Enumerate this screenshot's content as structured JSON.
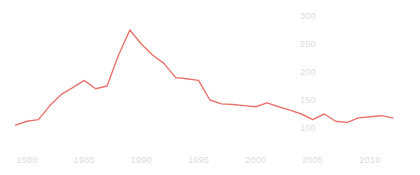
{
  "chart_data": {
    "type": "line",
    "title": "",
    "subtitle": "",
    "xlabel": "",
    "ylabel": "",
    "x": [
      1979,
      1980,
      1981,
      1982,
      1983,
      1984,
      1985,
      1986,
      1987,
      1988,
      1989,
      1990,
      1991,
      1992,
      1993,
      1994,
      1995,
      1996,
      1997,
      1998,
      1999,
      2000,
      2001,
      2002,
      2003,
      2004,
      2005,
      2006,
      2007,
      2008,
      2009,
      2010,
      2011,
      2012
    ],
    "values": [
      105,
      112,
      115,
      140,
      160,
      172,
      185,
      170,
      175,
      230,
      275,
      250,
      230,
      215,
      190,
      188,
      185,
      150,
      143,
      142,
      140,
      138,
      145,
      138,
      132,
      125,
      115,
      125,
      112,
      110,
      118,
      120,
      122,
      118
    ],
    "series": [
      {
        "name": "series-1",
        "color": "#e8736a",
        "values": [
          105,
          112,
          115,
          140,
          160,
          172,
          185,
          170,
          175,
          230,
          275,
          250,
          230,
          215,
          190,
          188,
          185,
          150,
          143,
          142,
          140,
          138,
          145,
          138,
          132,
          125,
          115,
          125,
          112,
          110,
          118,
          120,
          122,
          118
        ]
      }
    ],
    "xlim": [
      1978.5,
      2012.5
    ],
    "ylim": [
      95,
      305
    ],
    "x_ticks": [
      1980,
      1985,
      1990,
      1995,
      2000,
      2005,
      2010
    ],
    "x_tick_labels": [
      "1980",
      "1985",
      "1990",
      "1995",
      "2000",
      "2005",
      "2010"
    ],
    "y_ticks": [
      100,
      150,
      200,
      250,
      300
    ],
    "y_tick_labels": [
      "100",
      "150",
      "200",
      "250",
      "300"
    ],
    "grid": false,
    "legend": "none",
    "annotations": []
  },
  "style": {
    "line_color": "#e8736a",
    "tick_color": "#dcdcdc",
    "background": "#ffffff"
  },
  "axes": {
    "y_tick_x_position_px": 300,
    "x_tick_y_position_px": 155
  }
}
